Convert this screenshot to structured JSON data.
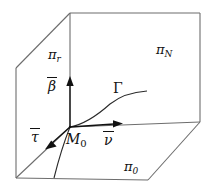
{
  "figure": {
    "background_color": "#ffffff",
    "line_color": "#6d6d6d",
    "accent_color": "#111111",
    "width": 211,
    "height": 190
  },
  "planes": [
    {
      "id": "pi-r",
      "symbol": "π",
      "subscript": "r",
      "position": "left-face"
    },
    {
      "id": "pi-N",
      "symbol": "π",
      "subscript": "N",
      "position": "back-face"
    },
    {
      "id": "pi-0",
      "symbol": "π",
      "subscript": "0",
      "position": "bottom-face"
    }
  ],
  "vectors": [
    {
      "id": "beta",
      "symbol": "β",
      "overbar": true,
      "direction": "up",
      "label": "β"
    },
    {
      "id": "nu",
      "symbol": "ν",
      "overbar": true,
      "direction": "right",
      "label": "ν"
    },
    {
      "id": "tau",
      "symbol": "τ",
      "overbar": true,
      "direction": "down-left",
      "label": "τ"
    }
  ],
  "point": {
    "id": "M0",
    "symbol": "M",
    "subscript": "0"
  },
  "curve": {
    "id": "Gamma",
    "symbol": "Γ"
  },
  "geometry": {
    "box_top_left": [
      70,
      13
    ],
    "box_top_right": [
      200,
      13
    ],
    "box_left_upper": [
      16,
      68
    ],
    "box_left_lower": [
      16,
      178
    ],
    "box_right_lower": [
      200,
      122
    ],
    "box_bottom_front": [
      148,
      180
    ],
    "origin": [
      70,
      127
    ]
  }
}
